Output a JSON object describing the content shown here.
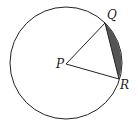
{
  "diagram": {
    "type": "circle-sector-segment",
    "circle": {
      "cx": 66,
      "cy": 63,
      "r": 56
    },
    "points": {
      "P": {
        "label": "P",
        "x": 66,
        "y": 64
      },
      "Q": {
        "label": "Q",
        "x": 105,
        "y": 23
      },
      "R": {
        "label": "R",
        "x": 119,
        "y": 79
      }
    },
    "shaded_region": "segment between chord QR and arc QR",
    "shade_color": "#555555",
    "line_color": "#222222"
  }
}
